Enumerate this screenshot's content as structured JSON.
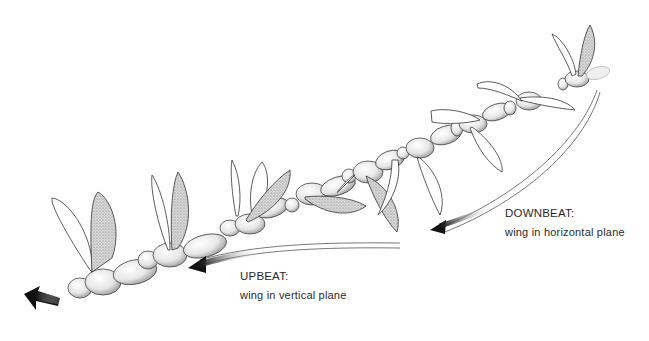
{
  "figure": {
    "background": "#ffffff",
    "ink_color": "#1a1a1a",
    "shade_color": "#9a9a9a"
  },
  "labels": {
    "downbeat": {
      "title": "DOWNBEAT:",
      "description": "wing in horizontal plane"
    },
    "upbeat": {
      "title": "UPBEAT:",
      "description": "wing in vertical plane"
    }
  },
  "arrows": {
    "downbeat_arrow": "curved arrow from upper right pointing down-left",
    "upbeat_arrow": "curved arrow pointing left",
    "direction_arrow": "motion arrow at lower left"
  }
}
